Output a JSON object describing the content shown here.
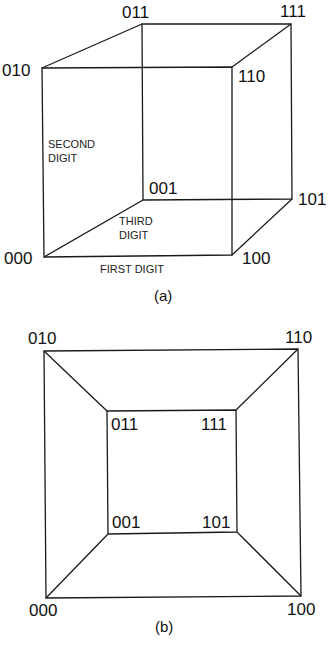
{
  "figure_a": {
    "caption": "(a)",
    "vertices": {
      "000": "000",
      "001": "001",
      "010": "010",
      "011": "011",
      "100": "100",
      "101": "101",
      "110": "110",
      "111": "111"
    },
    "axis_labels": {
      "first_digit": "FIRST DIGIT",
      "second_digit_line1": "SECOND",
      "second_digit_line2": "DIGIT",
      "third_digit_line1": "THIRD",
      "third_digit_line2": "DIGIT"
    }
  },
  "figure_b": {
    "caption": "(b)",
    "vertices": {
      "000": "000",
      "001": "001",
      "010": "010",
      "011": "011",
      "100": "100",
      "101": "101",
      "110": "110",
      "111": "111"
    }
  }
}
